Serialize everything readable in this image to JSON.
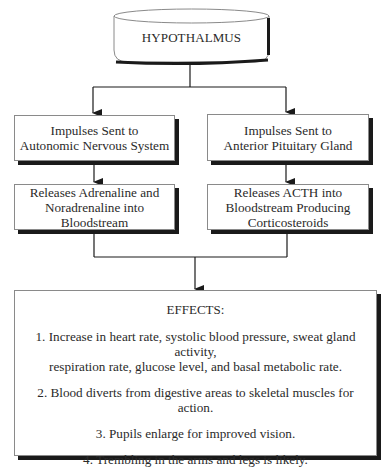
{
  "diagram": {
    "root": {
      "label": "HYPOTHALMUS",
      "shape": "cylinder"
    },
    "left_branch": {
      "step1": {
        "line1": "Impulses Sent to",
        "line2": "Autonomic Nervous System"
      },
      "step2": {
        "line1": "Releases Adrenaline and",
        "line2": "Noradrenaline into Bloodstream"
      }
    },
    "right_branch": {
      "step1": {
        "line1": "Impulses Sent to",
        "line2": "Anterior Pituitary Gland"
      },
      "step2": {
        "line1": "Releases ACTH into",
        "line2": "Bloodstream Producing",
        "line3": "Corticosteroids"
      }
    },
    "effects": {
      "title": "EFFECTS:",
      "items": [
        {
          "line1": "1. Increase in heart rate, systolic blood pressure, sweat gland activity,",
          "line2": "respiration rate, glucose level, and basal metabolic rate."
        },
        {
          "line1": "2. Blood diverts from digestive areas to skeletal muscles for action."
        },
        {
          "line1": "3. Pupils enlarge for improved vision."
        },
        {
          "line1": "4. Trembling in the arms and legs is likely."
        }
      ]
    },
    "colors": {
      "line": "#1a1a1a",
      "shadow": "#1a1a1a",
      "border": "#8a8a8a",
      "background": "#ffffff"
    }
  }
}
